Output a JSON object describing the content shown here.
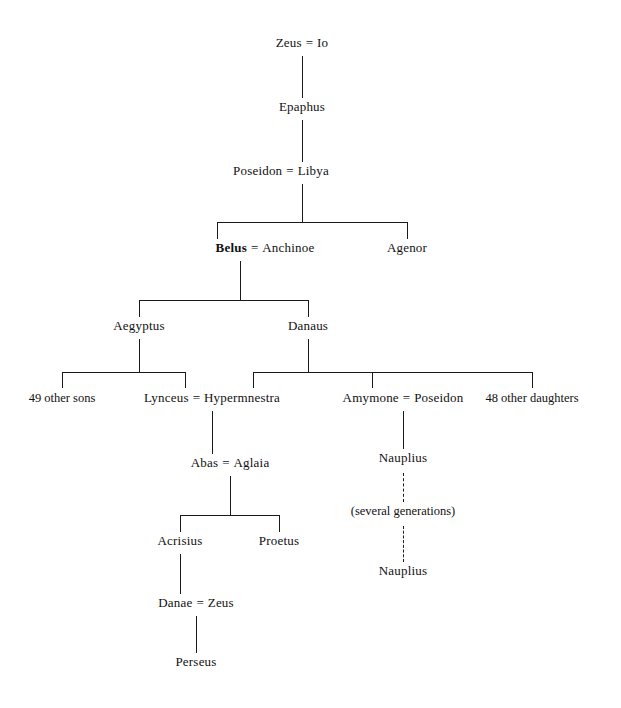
{
  "diagram": {
    "nodes": {
      "zeus_io": {
        "left": "Zeus",
        "sep": "=",
        "right": "Io"
      },
      "epaphus": {
        "label": "Epaphus"
      },
      "poseidon_libya": {
        "left": "Poseidon",
        "sep": "=",
        "right": "Libya"
      },
      "belus_anchinoe": {
        "left": "Belus",
        "sep": "=",
        "right": "Anchinoe"
      },
      "agenor": {
        "label": "Agenor"
      },
      "aegyptus": {
        "label": "Aegyptus"
      },
      "danaus": {
        "label": "Danaus"
      },
      "other_sons": {
        "label": "49 other sons"
      },
      "lynceus_hypermnestra": {
        "left": "Lynceus",
        "sep": "=",
        "right": "Hypermnestra"
      },
      "amymone_poseidon": {
        "left": "Amymone",
        "sep": "=",
        "right": "Poseidon"
      },
      "other_daughters": {
        "label": "48 other daughters"
      },
      "abas_aglaia": {
        "left": "Abas",
        "sep": "=",
        "right": "Aglaia"
      },
      "nauplius_upper": {
        "label": "Nauplius"
      },
      "several_generations": {
        "label": "(several generations)"
      },
      "nauplius_lower": {
        "label": "Nauplius"
      },
      "acrisius": {
        "label": "Acrisius"
      },
      "proetus": {
        "label": "Proetus"
      },
      "danae_zeus": {
        "left": "Danae",
        "sep": "=",
        "right": "Zeus"
      },
      "perseus": {
        "label": "Perseus"
      }
    },
    "style": {
      "line_color": "#1a1a1a",
      "text_color": "#111111",
      "background": "#ffffff"
    }
  }
}
